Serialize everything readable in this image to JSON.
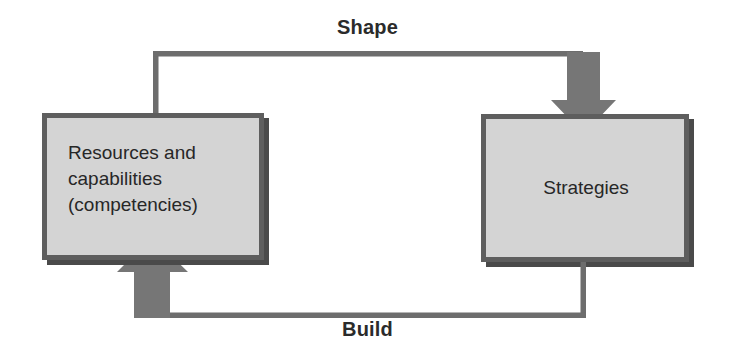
{
  "diagram": {
    "nodes": [
      {
        "id": "resources",
        "label": "Resources and\ncapabilities\n(competencies)",
        "line1": "Resources and",
        "line2": "capabilities",
        "line3": "(competencies)",
        "align": "left"
      },
      {
        "id": "strategies",
        "label": "Strategies",
        "align": "center"
      }
    ],
    "edges": [
      {
        "id": "shape",
        "label": "Shape",
        "from": "resources",
        "to": "strategies",
        "direction": "down-arrow-into-strategies",
        "position": "top"
      },
      {
        "id": "build",
        "label": "Build",
        "from": "strategies",
        "to": "resources",
        "direction": "up-arrow-into-resources",
        "position": "bottom"
      }
    ],
    "colors": {
      "box_fill": "#d4d4d4",
      "box_border": "#5e5e5e",
      "box_shadow": "#4a4a4a",
      "connector": "#6d6d6d",
      "arrow_fill": "#767676",
      "text": "#272727",
      "label_text": "#2b2b2b",
      "background": "#ffffff"
    }
  }
}
